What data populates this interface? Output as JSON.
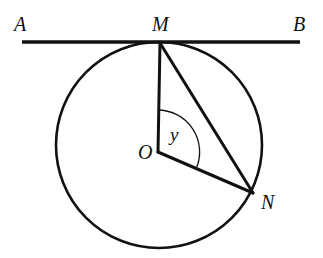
{
  "figure": {
    "kind": "circle-tangent-geometry-diagram",
    "background_color": "#ffffff",
    "stroke_color": "#111111",
    "canvas": {
      "width": 323,
      "height": 258
    }
  },
  "labels": {
    "tangent_left": "A",
    "tangent_right": "B",
    "tangent_point": "M",
    "circle_point": "N",
    "centre": "O",
    "angle": "y"
  },
  "geometry": {
    "circle": {
      "cx": 159,
      "cy": 145,
      "r": 103,
      "stroke_width": 2.6
    },
    "tangent_line": {
      "x1": 22,
      "y1": 42,
      "x2": 300,
      "y2": 42,
      "stroke_width": 3.4
    },
    "points": {
      "M": {
        "x": 160,
        "y": 43
      },
      "O": {
        "x": 158,
        "y": 152
      },
      "N": {
        "x": 253,
        "y": 193
      }
    },
    "segments": [
      {
        "name": "OM",
        "x1": 158,
        "y1": 152,
        "x2": 160,
        "y2": 43,
        "stroke_width": 3.0
      },
      {
        "name": "MN",
        "x1": 160,
        "y1": 43,
        "x2": 253,
        "y2": 193,
        "stroke_width": 3.0
      },
      {
        "name": "ON",
        "x1": 158,
        "y1": 152,
        "x2": 253,
        "y2": 193,
        "stroke_width": 3.0
      }
    ],
    "angle_arc": {
      "name": "angle-MON",
      "vertex": {
        "x": 158,
        "y": 152
      },
      "radius": 42,
      "start_deg_from_up": 0,
      "end_deg_from_up": 113,
      "sweep": "clockwise",
      "stroke_width": 1.3,
      "path": "M 158 110 A 42 42 0 0 1 196.67 167.52"
    }
  }
}
